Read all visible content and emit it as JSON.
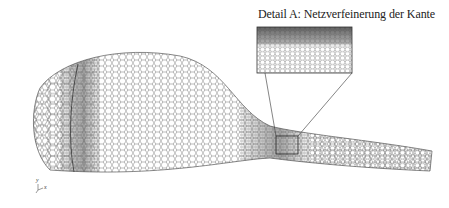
{
  "figure": {
    "caption": "Detail A: Netzverfeinerung der Kante",
    "axes": {
      "y_label": "y",
      "x_label": "x",
      "z_label": "z"
    },
    "colors": {
      "mesh_line": "#555555",
      "dense_mesh": "#6a6a6a",
      "outline": "#333333",
      "background": "#ffffff"
    }
  }
}
